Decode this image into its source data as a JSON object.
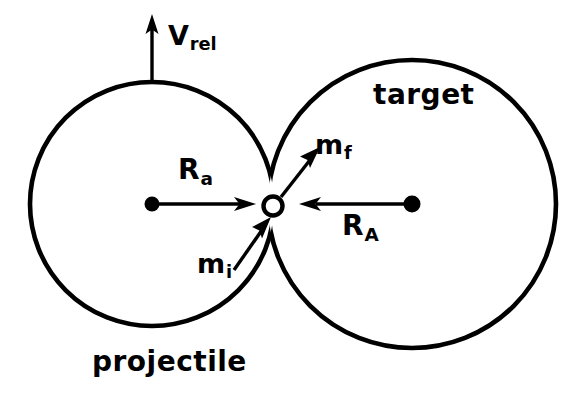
{
  "figure": {
    "type": "physics-collision-schematic",
    "background_color": "#ffffff",
    "stroke_color": "#000000"
  },
  "labels": {
    "v_rel": {
      "base": "V",
      "sub": "rel",
      "text": "Vrel"
    },
    "target": {
      "text": "target"
    },
    "projectile": {
      "text": "projectile"
    },
    "m_f": {
      "base": "m",
      "sub": "f",
      "text": "mf"
    },
    "m_i": {
      "base": "m",
      "sub": "i",
      "text": "mi"
    },
    "R_a": {
      "base": "R",
      "sub": "a",
      "text": "Ra"
    },
    "R_A": {
      "base": "R",
      "sub": "A",
      "text": "RA"
    }
  },
  "shapes": {
    "projectile_circle": {
      "cx": 152,
      "cy": 204,
      "r": 122
    },
    "target_circle": {
      "cx": 412,
      "cy": 204,
      "r": 144
    },
    "contact_point": {
      "cx": 273,
      "cy": 206,
      "r": 9,
      "fill": "none"
    },
    "projectile_center_dot": {
      "cx": 152,
      "cy": 204,
      "r": 7,
      "fill": "#000000"
    },
    "target_center_dot": {
      "cx": 412,
      "cy": 204,
      "r": 8,
      "fill": "#000000"
    }
  },
  "arrows": {
    "v_rel_arrow": {
      "from": [
        152,
        80
      ],
      "to": [
        152,
        18
      ],
      "direction": "up"
    },
    "R_a_arrow": {
      "from": [
        152,
        204
      ],
      "to": [
        252,
        204
      ],
      "direction": "right"
    },
    "R_A_arrow": {
      "from": [
        412,
        204
      ],
      "to": [
        300,
        204
      ],
      "direction": "left"
    },
    "m_f_arrow": {
      "from": [
        282,
        196
      ],
      "to": [
        318,
        150
      ],
      "direction": "up-right"
    },
    "m_i_arrow": {
      "from": [
        236,
        268
      ],
      "to": [
        266,
        222
      ],
      "direction": "up-right"
    }
  }
}
